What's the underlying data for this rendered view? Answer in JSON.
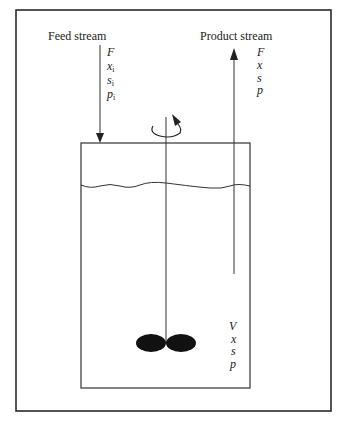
{
  "figure": {
    "type": "continuous stirred tank reactor schematic",
    "feed": {
      "label": "Feed stream",
      "variables": [
        {
          "symbol": "F",
          "sub": ""
        },
        {
          "symbol": "x",
          "sub": "i"
        },
        {
          "symbol": "s",
          "sub": "i"
        },
        {
          "symbol": "p",
          "sub": "i"
        }
      ]
    },
    "product": {
      "label": "Product stream",
      "variables": [
        {
          "symbol": "F",
          "sub": ""
        },
        {
          "symbol": "x",
          "sub": ""
        },
        {
          "symbol": "s",
          "sub": ""
        },
        {
          "symbol": "p",
          "sub": ""
        }
      ]
    },
    "vessel": {
      "variables": [
        {
          "symbol": "V",
          "sub": ""
        },
        {
          "symbol": "x",
          "sub": ""
        },
        {
          "symbol": "s",
          "sub": ""
        },
        {
          "symbol": "p",
          "sub": ""
        }
      ]
    },
    "icons": {
      "rotation": "rotation-arrow-icon",
      "impeller": "impeller-icon"
    },
    "colors": {
      "line": "#2a2a2a",
      "impeller": "#111111",
      "background": "#ffffff"
    }
  }
}
